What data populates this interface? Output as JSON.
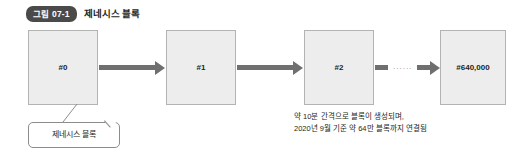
{
  "figure": {
    "badge": "그림 07-1",
    "title": "제네시스 블록"
  },
  "chain": {
    "blocks": [
      {
        "label": "#0"
      },
      {
        "label": "#1"
      },
      {
        "label": "#2"
      },
      {
        "label": "#640,000"
      }
    ],
    "ellipsis": "......"
  },
  "callout": {
    "label": "제네시스 블록"
  },
  "caption": {
    "line1": "약 10분 간격으로 블록이 생성되며,",
    "line2": "2020년 9월 기준 약 64만 블록까지 연결됨"
  },
  "colors": {
    "badge_bg": "#4a4a4a",
    "block_fill": "#ededed",
    "block_border": "#b3b3b3",
    "arrow": "#6f6f6f",
    "text": "#231f20",
    "background": "#ffffff"
  }
}
